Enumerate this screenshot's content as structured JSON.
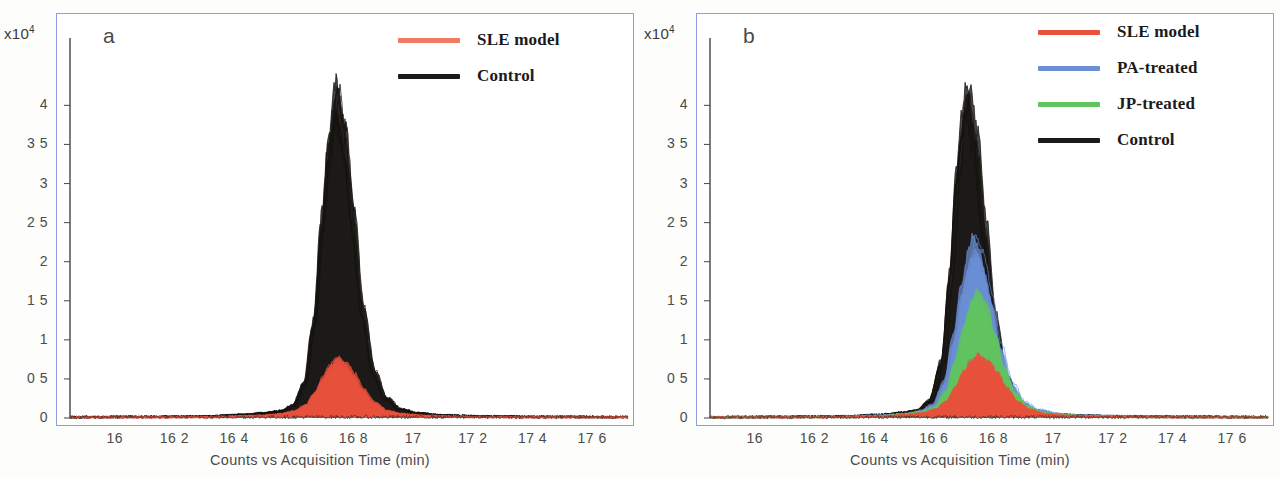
{
  "figure": {
    "panels": [
      "a",
      "b"
    ]
  },
  "panel_a": {
    "letter": "a",
    "exponent_prefix": "x10",
    "exponent_power": "4",
    "axis_title": "Counts vs  Acquisition Time (min)",
    "legend": [
      {
        "label": "SLE model",
        "color": "#ef7a63"
      },
      {
        "label": "Control",
        "color": "#1a1a1a"
      }
    ],
    "yticks": [
      "0",
      "0 5",
      "1",
      "1 5",
      "2",
      "2 5",
      "3",
      "3 5",
      "4"
    ],
    "xticks": [
      "16",
      "16 2",
      "16 4",
      "16 6",
      "16 8",
      "17",
      "17 2",
      "17 4",
      "17 6"
    ]
  },
  "panel_b": {
    "letter": "b",
    "exponent_prefix": "x10",
    "exponent_power": "4",
    "axis_title": "Counts vs  Acquisition Time (min)",
    "legend": [
      {
        "label": "SLE model",
        "color": "#e8513c"
      },
      {
        "label": "PA-treated",
        "color": "#6b8fd4"
      },
      {
        "label": "JP-treated",
        "color": "#5fc45f"
      },
      {
        "label": "Control",
        "color": "#1a1a1a"
      }
    ],
    "yticks": [
      "0",
      "0 5",
      "1",
      "1 5",
      "2",
      "2 5",
      "3",
      "3 5",
      "4"
    ],
    "xticks": [
      "16",
      "16 2",
      "16 4",
      "16 6",
      "16 8",
      "17",
      "17 2",
      "17 4",
      "17 6"
    ]
  },
  "colors": {
    "frame": "#8c9ede",
    "black_trace": "#171717",
    "red_trace": "#e8513c",
    "red_fill": "#ee7a5e",
    "blue_trace": "#6b8fd4",
    "blue_fill": "#7b7fc0",
    "green_trace": "#4f9e4f",
    "green_fill": "#5f8a5f",
    "axis_text": "#4b4b4b"
  },
  "chart_data": {
    "type": "line",
    "xlabel": "Counts vs  Acquisition Time (min)",
    "ylabel": "Counts (x10^4)",
    "xlim": [
      15.85,
      17.72
    ],
    "ylim": [
      0,
      4.35
    ],
    "y_exponent": 10000,
    "grid": false,
    "legend_position": "top-right",
    "xtick_values": [
      16,
      16.2,
      16.4,
      16.6,
      16.8,
      17,
      17.2,
      17.4,
      17.6
    ],
    "ytick_values": [
      0,
      0.5,
      1,
      1.5,
      2,
      2.5,
      3,
      3.5,
      4
    ],
    "panels": [
      {
        "panel": "a",
        "series": [
          {
            "name": "Control",
            "color": "#171717",
            "filled": true,
            "peak_center": 16.745,
            "peak_height": 4.05,
            "peak_width_half_max": 0.075,
            "n_overlaid_traces": 10,
            "x": [
              15.85,
              16.1,
              16.3,
              16.42,
              16.5,
              16.56,
              16.6,
              16.64,
              16.67,
              16.7,
              16.72,
              16.745,
              16.77,
              16.8,
              16.83,
              16.87,
              16.91,
              16.96,
              17.02,
              17.1,
              17.25,
              17.45,
              17.7
            ],
            "y": [
              0.01,
              0.015,
              0.02,
              0.04,
              0.06,
              0.09,
              0.16,
              0.45,
              1.2,
              2.55,
              3.45,
              4.05,
              3.6,
              2.55,
              1.4,
              0.58,
              0.25,
              0.11,
              0.06,
              0.035,
              0.02,
              0.015,
              0.012
            ]
          },
          {
            "name": "SLE model",
            "color": "#e8513c",
            "filled": true,
            "peak_center": 16.745,
            "peak_height": 0.72,
            "peak_width_half_max": 0.085,
            "n_overlaid_traces": 8,
            "x": [
              15.85,
              16.1,
              16.3,
              16.42,
              16.5,
              16.56,
              16.6,
              16.64,
              16.67,
              16.7,
              16.72,
              16.745,
              16.77,
              16.8,
              16.83,
              16.87,
              16.91,
              16.96,
              17.02,
              17.1,
              17.25,
              17.45,
              17.7
            ],
            "y": [
              0.008,
              0.01,
              0.012,
              0.02,
              0.03,
              0.05,
              0.08,
              0.15,
              0.3,
              0.5,
              0.63,
              0.72,
              0.66,
              0.52,
              0.34,
              0.18,
              0.09,
              0.05,
              0.03,
              0.02,
              0.012,
              0.01,
              0.008
            ]
          }
        ]
      },
      {
        "panel": "b",
        "series": [
          {
            "name": "Control",
            "color": "#171717",
            "filled": true,
            "peak_center": 16.715,
            "peak_height": 4.05,
            "peak_width_half_max": 0.072,
            "n_overlaid_traces": 10,
            "x": [
              15.85,
              16.1,
              16.3,
              16.42,
              16.5,
              16.55,
              16.59,
              16.63,
              16.66,
              16.68,
              16.7,
              16.715,
              16.74,
              16.77,
              16.8,
              16.84,
              16.88,
              16.93,
              17.0,
              17.1,
              17.25,
              17.45,
              17.7
            ],
            "y": [
              0.01,
              0.015,
              0.02,
              0.04,
              0.07,
              0.1,
              0.22,
              0.7,
              1.8,
              3.0,
              3.7,
              4.05,
              3.5,
              2.4,
              1.3,
              0.52,
              0.22,
              0.1,
              0.05,
              0.03,
              0.02,
              0.015,
              0.012
            ]
          },
          {
            "name": "PA-treated",
            "color": "#6b8fd4",
            "filled": true,
            "peak_center": 16.735,
            "peak_height": 2.2,
            "peak_width_half_max": 0.082,
            "n_overlaid_traces": 6,
            "x": [
              15.85,
              16.1,
              16.3,
              16.42,
              16.5,
              16.55,
              16.6,
              16.64,
              16.67,
              16.7,
              16.72,
              16.735,
              16.76,
              16.79,
              16.82,
              16.86,
              16.9,
              16.95,
              17.02,
              17.1,
              17.25,
              17.45,
              17.7
            ],
            "y": [
              0.01,
              0.012,
              0.015,
              0.03,
              0.05,
              0.08,
              0.16,
              0.45,
              1.0,
              1.65,
              2.0,
              2.2,
              2.0,
              1.5,
              0.9,
              0.42,
              0.2,
              0.1,
              0.05,
              0.03,
              0.018,
              0.012,
              0.01
            ]
          },
          {
            "name": "JP-treated",
            "color": "#5fc45f",
            "filled": true,
            "peak_center": 16.74,
            "peak_height": 1.52,
            "peak_width_half_max": 0.085,
            "n_overlaid_traces": 6,
            "x": [
              15.85,
              16.1,
              16.3,
              16.42,
              16.5,
              16.55,
              16.6,
              16.64,
              16.67,
              16.7,
              16.72,
              16.74,
              16.77,
              16.8,
              16.83,
              16.87,
              16.91,
              16.96,
              17.02,
              17.1,
              17.25,
              17.45,
              17.7
            ],
            "y": [
              0.009,
              0.011,
              0.014,
              0.025,
              0.045,
              0.07,
              0.13,
              0.33,
              0.7,
              1.12,
              1.38,
              1.52,
              1.38,
              1.02,
              0.62,
              0.3,
              0.14,
              0.07,
              0.04,
              0.025,
              0.015,
              0.011,
              0.009
            ]
          },
          {
            "name": "SLE model",
            "color": "#e8513c",
            "filled": true,
            "peak_center": 16.745,
            "peak_height": 0.76,
            "peak_width_half_max": 0.09,
            "n_overlaid_traces": 6,
            "x": [
              15.85,
              16.1,
              16.3,
              16.42,
              16.5,
              16.55,
              16.6,
              16.64,
              16.67,
              16.7,
              16.72,
              16.745,
              16.78,
              16.81,
              16.84,
              16.88,
              16.92,
              16.97,
              17.03,
              17.1,
              17.25,
              17.45,
              17.7
            ],
            "y": [
              0.008,
              0.01,
              0.012,
              0.02,
              0.035,
              0.055,
              0.1,
              0.2,
              0.38,
              0.57,
              0.68,
              0.76,
              0.68,
              0.54,
              0.36,
              0.19,
              0.1,
              0.05,
              0.03,
              0.02,
              0.013,
              0.01,
              0.008
            ]
          }
        ]
      }
    ]
  }
}
